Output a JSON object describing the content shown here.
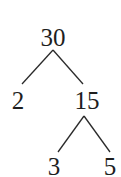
{
  "diagram": {
    "type": "factor-tree",
    "nodes": [
      {
        "id": "root",
        "label": "30",
        "x": 53,
        "y": 25
      },
      {
        "id": "left",
        "label": "2",
        "x": 18,
        "y": 88
      },
      {
        "id": "right",
        "label": "15",
        "x": 87,
        "y": 88
      },
      {
        "id": "right-left",
        "label": "3",
        "x": 54,
        "y": 154
      },
      {
        "id": "right-right",
        "label": "5",
        "x": 110,
        "y": 154
      }
    ],
    "edges": [
      {
        "from": "root",
        "to": "left"
      },
      {
        "from": "root",
        "to": "right"
      },
      {
        "from": "right",
        "to": "right-left"
      },
      {
        "from": "right",
        "to": "right-right"
      }
    ],
    "line_color": "#2a2a2a",
    "text_color": "#1e1e1e"
  }
}
